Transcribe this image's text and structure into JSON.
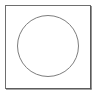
{
  "canvas": {
    "width": 98,
    "height": 95,
    "background_color": "#ffffff"
  },
  "figure": {
    "shapes": [
      {
        "name": "square-frame",
        "type": "rect",
        "x": 5.5,
        "y": 5.5,
        "width": 85,
        "height": 83,
        "fill": "none",
        "stroke_color": "#6e6e6e",
        "stroke_width": 1
      },
      {
        "name": "square-frame-shadow-bottom",
        "type": "line",
        "x1": 6,
        "y1": 89,
        "x2": 91.5,
        "y2": 89,
        "stroke_color": "#4d4d4d",
        "stroke_width": 1.2
      },
      {
        "name": "square-frame-shadow-right",
        "type": "line",
        "x1": 91,
        "y1": 6,
        "x2": 91,
        "y2": 89.5,
        "stroke_color": "#4d4d4d",
        "stroke_width": 1.2
      },
      {
        "name": "circle-outline",
        "type": "circle",
        "cx": 48,
        "cy": 46,
        "r": 30.5,
        "fill": "none",
        "stroke_color": "#7d7d7d",
        "stroke_width": 1
      }
    ]
  }
}
